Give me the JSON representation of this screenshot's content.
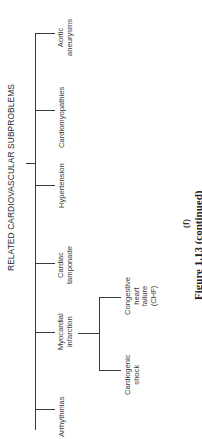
{
  "diagram": {
    "title": "RELATED CARDIOVASCULAR SUBPROBLEMS",
    "nodes": [
      {
        "id": "arrhythmias",
        "label": "Arrhythmias"
      },
      {
        "id": "mi",
        "label": "Myocardial infarction",
        "lines": [
          "Myocardial",
          "infarction"
        ]
      },
      {
        "id": "tamponade",
        "label": "Cardiac tamponade",
        "lines": [
          "Cardiac",
          "tamponade"
        ]
      },
      {
        "id": "hypertension",
        "label": "Hypertension"
      },
      {
        "id": "cardiomyopathies",
        "label": "Cardiomyopathies"
      },
      {
        "id": "aortic",
        "label": "Aortic aneurysms",
        "lines": [
          "Aortic",
          "aneurysms"
        ]
      }
    ],
    "mi_children": [
      {
        "id": "shock",
        "label": "Cardiogenic shock",
        "lines": [
          "Cardiogenic",
          "shock"
        ]
      },
      {
        "id": "chf",
        "label": "Congestive heart failure (CHF)",
        "lines": [
          "Congestive",
          "heart",
          "failure",
          "(CHF)"
        ]
      }
    ],
    "edges": [
      [
        "root",
        "arrhythmias"
      ],
      [
        "root",
        "mi"
      ],
      [
        "root",
        "tamponade"
      ],
      [
        "root",
        "hypertension"
      ],
      [
        "root",
        "cardiomyopathies"
      ],
      [
        "root",
        "aortic"
      ],
      [
        "mi",
        "shock"
      ],
      [
        "mi",
        "chf"
      ]
    ],
    "sublabel": "(f)",
    "caption": "Figure 1.13   (continued)"
  }
}
